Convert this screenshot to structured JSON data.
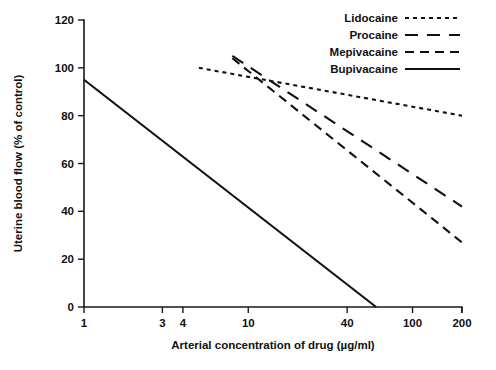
{
  "chart_data": {
    "type": "line",
    "title": "",
    "xlabel": "Arterial concentration of drug (µg/ml)",
    "ylabel": "Uterine blood flow (% of control)",
    "xscale": "log",
    "xlim": [
      1,
      200
    ],
    "ylim": [
      0,
      120
    ],
    "xticks": [
      1,
      3,
      4,
      10,
      40,
      100,
      200
    ],
    "xtick_labels": [
      "1",
      "3",
      "4",
      "10",
      "40",
      "100",
      "200"
    ],
    "yticks": [
      0,
      20,
      40,
      60,
      80,
      100,
      120
    ],
    "ytick_labels": [
      "0",
      "20",
      "40",
      "60",
      "80",
      "100",
      "120"
    ],
    "grid": false,
    "legend_position": "top-right",
    "series": [
      {
        "name": "Lidocaine",
        "dash": "4,4",
        "x": [
          5,
          200
        ],
        "values": [
          100,
          80
        ]
      },
      {
        "name": "Procaine",
        "dash": "13,9",
        "x": [
          8,
          200
        ],
        "values": [
          105,
          42
        ]
      },
      {
        "name": "Mepivacaine",
        "dash": "9,6",
        "x": [
          8,
          200
        ],
        "values": [
          104,
          27
        ]
      },
      {
        "name": "Bupivacaine",
        "dash": "none",
        "x": [
          1,
          60
        ],
        "values": [
          95,
          0
        ]
      }
    ]
  },
  "legend": {
    "items": [
      {
        "label": "Lidocaine",
        "dash": "4,4"
      },
      {
        "label": "Procaine",
        "dash": "13,9"
      },
      {
        "label": "Mepivacaine",
        "dash": "9,6"
      },
      {
        "label": "Bupivacaine",
        "dash": "none"
      }
    ]
  },
  "axes": {
    "x_title": "Arterial concentration of drug (µg/ml)",
    "y_title": "Uterine blood flow (% of control)"
  },
  "caption": {
    "text": "",
    "visible": false
  },
  "colors": {
    "ink": "#101010",
    "background": "#ffffff"
  }
}
